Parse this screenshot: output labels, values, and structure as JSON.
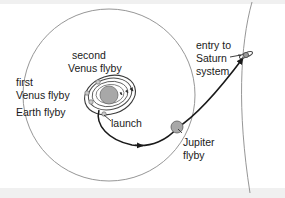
{
  "figure": {
    "background_color": "#ffffff",
    "edge_band_color": "#f0f0f0"
  },
  "colors": {
    "orbit_line": "#8a8a8a",
    "trajectory_line": "#1a1a1a",
    "inner_loop_line": "#4a4a4a",
    "sun_fill": "#a8a8a8",
    "sun_stroke": "#6e6e6e",
    "planet_fill": "#a8a8a8",
    "planet_stroke": "#5a5a5a",
    "marker_fill": "#c9c9c9",
    "marker_stroke": "#6e6e6e",
    "text": "#1a1a1a"
  },
  "labels": {
    "second_venus_flyby_line1": "second",
    "second_venus_flyby_line2": "Venus flyby",
    "first_venus_flyby_line1": "first",
    "first_venus_flyby_line2": "Venus flyby",
    "earth_flyby": "Earth flyby",
    "launch": "launch",
    "jupiter_flyby_line1": "Jupiter",
    "jupiter_flyby_line2": "flyby",
    "entry_line1": "entry to",
    "entry_line2": "Saturn",
    "entry_line3": "system"
  },
  "bodies": {
    "sun": {
      "name": "sun",
      "cx": 109,
      "cy": 95,
      "r": 9
    },
    "jupiter": {
      "name": "jupiter",
      "cx": 177,
      "cy": 127,
      "r": 6
    },
    "saturn": {
      "name": "saturn",
      "cx": 246,
      "cy": 55,
      "r": 3
    }
  },
  "orbits": {
    "jupiter_orbit": {
      "name": "jupiter-orbit",
      "cx": 109,
      "cy": 95,
      "r": 86
    },
    "saturn_orbit": {
      "name": "saturn-orbit",
      "cx": 109,
      "cy": 98,
      "r": 150
    }
  },
  "flyby_markers": [
    {
      "name": "first-venus-flyby-marker",
      "cx": 92,
      "cy": 101
    },
    {
      "name": "second-venus-flyby-marker",
      "cx": 97,
      "cy": 83
    },
    {
      "name": "earth-flyby-marker",
      "cx": 87,
      "cy": 94
    },
    {
      "name": "launch-marker",
      "cx": 103,
      "cy": 114
    }
  ],
  "icons": {
    "sun": "sun-icon",
    "jupiter": "planet-icon",
    "saturn": "ringed-planet-icon",
    "arrow": "arrowhead-icon"
  }
}
